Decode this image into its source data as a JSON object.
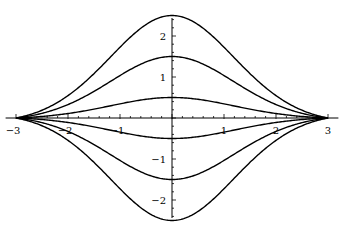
{
  "chart_data": {
    "type": "line",
    "title": "",
    "xlabel": "",
    "ylabel": "",
    "xlim": [
      -3,
      3
    ],
    "ylim": [
      -2.6,
      2.6
    ],
    "grid": false,
    "legend": null,
    "x_ticks": [
      -3,
      -2,
      -1,
      1,
      2,
      3
    ],
    "x_tick_labels": [
      "−3",
      "−2",
      "−1",
      "1",
      "2",
      "3"
    ],
    "y_ticks": [
      -2,
      -1,
      1,
      2
    ],
    "y_tick_labels": [
      "−2",
      "−1",
      "1",
      "2"
    ],
    "series": [
      {
        "name": "a=2.5",
        "peak": 2.5
      },
      {
        "name": "a=1.5",
        "peak": 1.5
      },
      {
        "name": "a=0.5",
        "peak": 0.5
      },
      {
        "name": "a=-0.5",
        "peak": -0.5
      },
      {
        "name": "a=-1.5",
        "peak": -1.5
      },
      {
        "name": "a=-2.5",
        "peak": -2.5
      }
    ],
    "curve_shape": "bell-shaped, a*exp(-x^2/2.7), converging to 0 at x=±3",
    "colors": {
      "line": "#000000",
      "axis": "#000000",
      "background": "#ffffff"
    }
  }
}
